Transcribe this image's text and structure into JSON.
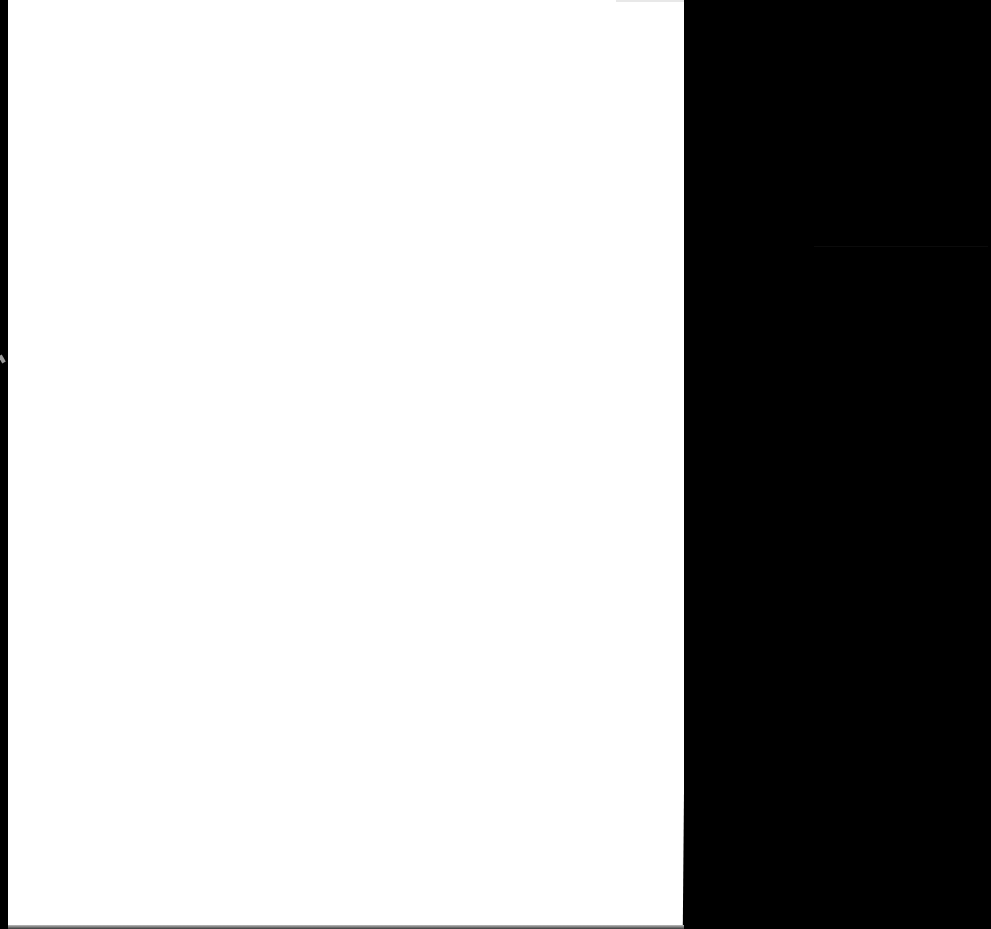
{
  "document": {
    "type": "blank scanned page",
    "content": "",
    "colors": {
      "paper": "#ffffff",
      "background": "#000000"
    }
  }
}
